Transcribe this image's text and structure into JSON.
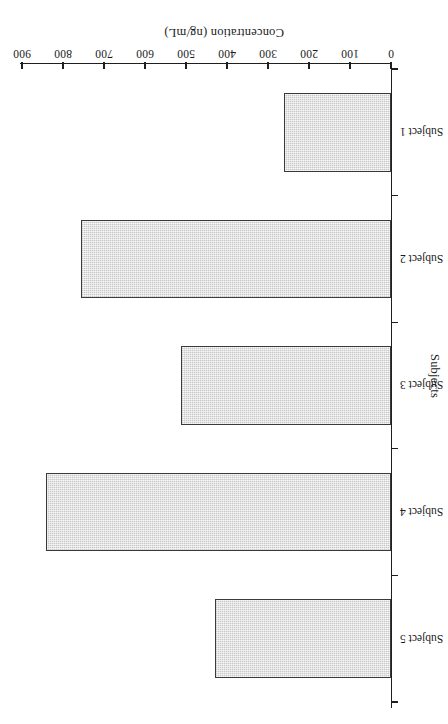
{
  "chart_data": {
    "type": "bar",
    "orientation": "horizontal",
    "title": "",
    "xlabel": "Concentration (ng/mL)",
    "ylabel": "Subjects",
    "categories": [
      "Subject 1",
      "Subject 2",
      "Subject 3",
      "Subject 4",
      "Subject 5"
    ],
    "values": [
      262,
      757,
      512,
      841,
      430
    ],
    "series": [
      {
        "name": "Concentration",
        "values": [
          262,
          757,
          512,
          841,
          430
        ]
      }
    ],
    "xlim": [
      0,
      900
    ],
    "ylim": null,
    "xticks": [
      0,
      100,
      200,
      300,
      400,
      500,
      600,
      700,
      800,
      900
    ],
    "xticklabels": [
      "0",
      "100",
      "200",
      "300",
      "400",
      "500",
      "600",
      "700",
      "800",
      "900"
    ],
    "grid": false,
    "legend": false,
    "legend_position": "none",
    "bar_fill_color": "#d6d6d6",
    "bar_edge_color": "#3a3a3a",
    "axis_color": "#1f1f1f",
    "background_color": "#ffffff",
    "page_rotation_degrees": 180,
    "annotations": []
  }
}
